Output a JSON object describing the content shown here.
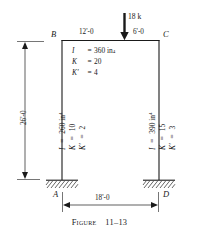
{
  "figure": {
    "caption_prefix": "Figure",
    "caption_number": "11–13",
    "caption_full": "Figure 11–13"
  },
  "nodes": {
    "top_left": "B",
    "top_right": "C",
    "bottom_left": "A",
    "bottom_right": "D"
  },
  "load": {
    "magnitude": "18 k",
    "arrow": "down-arrow-icon"
  },
  "dimensions": {
    "beam_left_segment": "12'-0",
    "beam_right_segment": "6'-0",
    "frame_height": "26'-0",
    "frame_span": "18'-0"
  },
  "members": {
    "beam": {
      "name": "beam-BC",
      "rows": [
        {
          "symbol": "I",
          "equals": "=",
          "value": "360 in",
          "exponent": "4"
        },
        {
          "symbol": "K",
          "equals": "=",
          "value": "20",
          "exponent": ""
        },
        {
          "symbol": "K′",
          "equals": "=",
          "value": "4",
          "exponent": ""
        }
      ]
    },
    "left_column": {
      "name": "column-AB",
      "rows": [
        {
          "symbol": "I",
          "equals": "=",
          "value": "260 in",
          "exponent": "4"
        },
        {
          "symbol": "K",
          "equals": "=",
          "value": "10",
          "exponent": ""
        },
        {
          "symbol": "K′",
          "equals": "=",
          "value": "2",
          "exponent": ""
        }
      ]
    },
    "right_column": {
      "name": "column-CD",
      "rows": [
        {
          "symbol": "I",
          "equals": "=",
          "value": "390 in",
          "exponent": "4"
        },
        {
          "symbol": "K",
          "equals": "=",
          "value": "15",
          "exponent": ""
        },
        {
          "symbol": "K′",
          "equals": "=",
          "value": "3",
          "exponent": ""
        }
      ]
    }
  },
  "supports": {
    "left": "fixed-support-hatching",
    "right": "fixed-support-hatching"
  },
  "colors": {
    "line": "#1a1a1a",
    "hatch": "#555555",
    "background": "#ffffff"
  }
}
